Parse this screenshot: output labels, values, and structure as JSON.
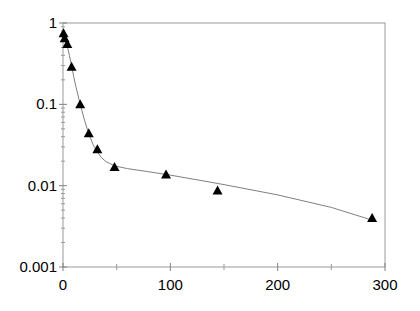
{
  "chart_data": {
    "type": "scatter",
    "title": "",
    "xlabel": "",
    "ylabel": "",
    "xlim": [
      0,
      300
    ],
    "ylim": [
      0.001,
      1
    ],
    "yscale": "log",
    "grid": false,
    "legend": null,
    "x_ticks": [
      0,
      100,
      200,
      300
    ],
    "x_tick_labels": [
      "0",
      "100",
      "200",
      "300"
    ],
    "x_minor_ticks": [
      50,
      150,
      250
    ],
    "y_ticks": [
      0.001,
      0.01,
      0.1,
      1
    ],
    "y_tick_labels": [
      "0.001",
      "0.01",
      "0.1",
      "1"
    ],
    "series": [
      {
        "name": "data",
        "marker": "triangle",
        "color": "#000000",
        "x": [
          0.5,
          1.5,
          4,
          8,
          16,
          24,
          32,
          48,
          96,
          144,
          288
        ],
        "y": [
          0.75,
          0.65,
          0.55,
          0.29,
          0.1,
          0.044,
          0.028,
          0.017,
          0.0137,
          0.0087,
          0.004
        ]
      },
      {
        "name": "fit",
        "type": "line",
        "color": "#808080",
        "x": [
          0,
          2,
          4,
          6,
          8,
          10,
          12,
          16,
          20,
          24,
          28,
          32,
          36,
          40,
          48,
          60,
          80,
          100,
          150,
          200,
          250,
          290
        ],
        "y": [
          0.78,
          0.64,
          0.52,
          0.4,
          0.3,
          0.22,
          0.165,
          0.1,
          0.064,
          0.043,
          0.032,
          0.026,
          0.022,
          0.0198,
          0.0175,
          0.0162,
          0.0148,
          0.0135,
          0.0103,
          0.0077,
          0.0054,
          0.0037
        ]
      }
    ]
  }
}
